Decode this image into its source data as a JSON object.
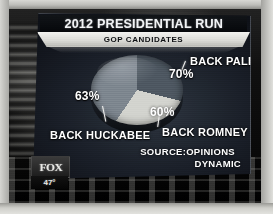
{
  "broadcast": {
    "network_bug": "FOX",
    "temperature": "47°"
  },
  "graphic": {
    "title": "2012 PRESIDENTIAL RUN",
    "subtitle": "GOP CANDIDATES",
    "source_line_1": "SOURCE:OPINIONS",
    "source_line_2": "DYNAMIC"
  },
  "chart_data": {
    "type": "pie",
    "title": "2012 PRESIDENTIAL RUN",
    "subtitle": "GOP CANDIDATES",
    "categories": [
      "BACK PALIN",
      "BACK ROMNEY",
      "BACK HUCKABEE"
    ],
    "values": [
      70,
      63,
      60
    ],
    "value_labels": [
      "70%",
      "60%",
      "63%"
    ],
    "slices": [
      {
        "label": "BACK PALIN",
        "value": 70,
        "display": "70%",
        "color": "#4e5862",
        "position": "upper-right"
      },
      {
        "label": "BACK ROMNEY",
        "value": 60,
        "display": "60%",
        "color": "#d3d4cf",
        "position": "lower-right"
      },
      {
        "label": "BACK HUCKABEE",
        "value": 63,
        "display": "63%",
        "color": "#7e8790",
        "position": "left"
      }
    ],
    "unit": "%",
    "total_shown": 193,
    "legend": "none",
    "grid": false,
    "source": "SOURCE:OPINIONS DYNAMIC"
  },
  "labels": {
    "palin": "BACK PALIN",
    "romney": "BACK ROMNEY",
    "huckabee": "BACK HUCKABEE"
  },
  "percents": {
    "palin": "70%",
    "romney": "60%",
    "huckabee": "63%"
  }
}
